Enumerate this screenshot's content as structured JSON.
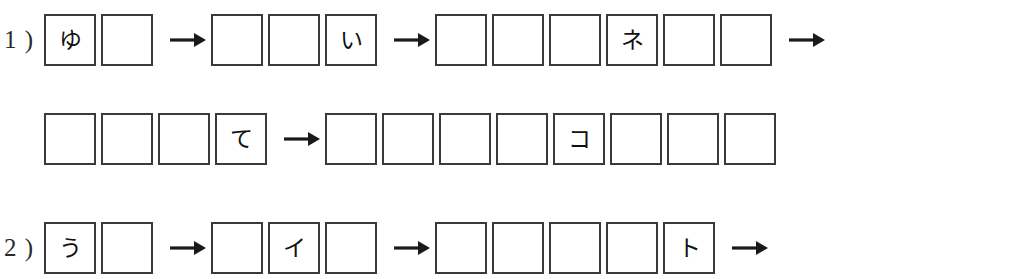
{
  "page": {
    "background_color": "#ffffff",
    "ink_color": "#3a3a3a"
  },
  "arrow_glyph": "→",
  "lines": [
    {
      "id": "line-1-a",
      "label": "1 )",
      "top": 14,
      "indent": false,
      "groups": [
        {
          "cells": [
            "ゆ",
            ""
          ]
        },
        {
          "arrow": true
        },
        {
          "cells": [
            "",
            "",
            "い"
          ]
        },
        {
          "arrow": true
        },
        {
          "cells": [
            "",
            "",
            "",
            "ネ",
            "",
            ""
          ]
        },
        {
          "arrow": true
        }
      ]
    },
    {
      "id": "line-1-b",
      "label": "",
      "top": 113,
      "indent": true,
      "groups": [
        {
          "cells": [
            "",
            "",
            "",
            "て"
          ]
        },
        {
          "arrow": true
        },
        {
          "cells": [
            "",
            "",
            "",
            "",
            "コ",
            "",
            "",
            ""
          ]
        }
      ]
    },
    {
      "id": "line-2-a",
      "label": "2 )",
      "top": 222,
      "indent": false,
      "groups": [
        {
          "cells": [
            "う",
            ""
          ]
        },
        {
          "arrow": true
        },
        {
          "cells": [
            "",
            "イ",
            ""
          ]
        },
        {
          "arrow": true
        },
        {
          "cells": [
            "",
            "",
            "",
            "",
            "ト"
          ]
        },
        {
          "arrow": true
        }
      ]
    }
  ]
}
